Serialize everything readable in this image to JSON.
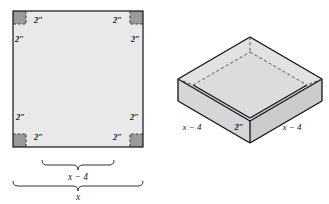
{
  "figure": {
    "palette": {
      "sheet_fill": "#e9e9e9",
      "corner_fill": "#9a9a9a",
      "outline": "#111111",
      "dashed": "#444444",
      "box_top_fill": "#e2e2e2",
      "box_inner_fill": "#dcdcdc",
      "box_side_fill": "#d2d2d2",
      "background": "#ffffff",
      "brace_stroke": "#333333"
    },
    "left_diagram": {
      "name": "square-sheet-with-corner-cutouts",
      "sheet": {
        "x": 13,
        "y": 11,
        "width": 130,
        "height": 136
      },
      "cut_size": 13,
      "corner_labels": [
        {
          "id": "top-left-inner",
          "text": "2″",
          "x": 34,
          "y": 21
        },
        {
          "id": "top-left-outer",
          "text": "2″",
          "x": 15,
          "y": 40
        },
        {
          "id": "top-right-inner",
          "text": "2″",
          "x": 110,
          "y": 21
        },
        {
          "id": "top-right-outer",
          "text": "2″",
          "x": 128,
          "y": 40
        },
        {
          "id": "bottom-left-outer",
          "text": "2″",
          "x": 16,
          "y": 118
        },
        {
          "id": "bottom-left-inner",
          "text": "2″",
          "x": 36,
          "y": 137
        },
        {
          "id": "bottom-right-inner",
          "text": "2″",
          "x": 108,
          "y": 137
        },
        {
          "id": "bottom-right-outer",
          "text": "2″",
          "x": 127,
          "y": 118
        }
      ],
      "braces": [
        {
          "id": "inner-brace",
          "label": "x − 4",
          "label_x": 78,
          "label_y": 177
        },
        {
          "id": "outer-brace",
          "label": "x",
          "label_x": 78,
          "label_y": 197
        }
      ]
    },
    "right_diagram": {
      "name": "open-box-isometric",
      "labels": [
        {
          "id": "left-base-edge",
          "text": "x − 4",
          "x": 190,
          "y": 128
        },
        {
          "id": "box-height",
          "text": "2″",
          "x": 238,
          "y": 128
        },
        {
          "id": "right-base-edge",
          "text": "x − 4",
          "x": 290,
          "y": 128
        }
      ]
    }
  }
}
